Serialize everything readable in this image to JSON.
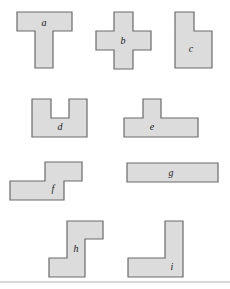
{
  "figure": {
    "colors": {
      "fill": "#dcdcdc",
      "stroke": "#6a6a6a",
      "rule": "#b4b4b4"
    },
    "shapes": [
      {
        "id": "a",
        "label": "a",
        "kind": "T-shape",
        "points": "17,12 72,12 72,31 53,31 53,68 35,68 35,31 17,31",
        "lx": 44,
        "ly": 26
      },
      {
        "id": "b",
        "label": "b",
        "kind": "plus-shape",
        "points": "114,12 133,12 133,31 151,31 151,50 133,50 133,69 114,69 114,50 96,50 96,31 114,31",
        "lx": 123,
        "ly": 44
      },
      {
        "id": "c",
        "label": "c",
        "kind": "notched-rectangle",
        "points": "175,12 194,12 194,31 212,31 212,68 175,68",
        "lx": 191,
        "ly": 52
      },
      {
        "id": "d",
        "label": "d",
        "kind": "U-shape",
        "points": "32,99 51,99 51,118 69,118 69,99 87,99 87,137 32,137",
        "lx": 60,
        "ly": 130
      },
      {
        "id": "e",
        "label": "e",
        "kind": "bump-bar",
        "points": "143,99 161,99 161,118 198,118 198,137 124,137 124,118 143,118",
        "lx": 152,
        "ly": 130
      },
      {
        "id": "f",
        "label": "f",
        "kind": "S-shape",
        "points": "45,162 82,162 82,181 64,181 64,200 10,200 10,181 45,181",
        "lx": 53,
        "ly": 192
      },
      {
        "id": "g",
        "label": "g",
        "kind": "long-bar",
        "points": "127,163 218,163 218,182 127,182",
        "lx": 171,
        "ly": 176
      },
      {
        "id": "h",
        "label": "h",
        "kind": "Z-shape",
        "points": "67,221 103,221 103,239 85,239 85,277 49,277 49,258 67,258",
        "lx": 76,
        "ly": 252
      },
      {
        "id": "i",
        "label": "i",
        "kind": "L-shape",
        "points": "165,221 183,221 183,277 128,277 128,258 165,258",
        "lx": 172,
        "ly": 270
      }
    ]
  }
}
